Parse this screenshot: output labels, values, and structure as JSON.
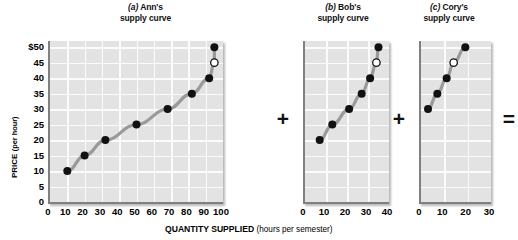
{
  "figure": {
    "axis_titles": {
      "y_main": "PRICE",
      "y_sub": "(per hour)",
      "x_main": "QUANTITY SUPPLIED",
      "x_sub": "(hours per semester)"
    },
    "operators": [
      {
        "symbol": "+",
        "name": "plus-operator-1"
      },
      {
        "symbol": "+",
        "name": "plus-operator-2"
      },
      {
        "symbol": "=",
        "name": "equals-operator"
      }
    ]
  },
  "chart_data": [
    {
      "type": "line",
      "panel": "a",
      "title_prefix": "(a)",
      "title_name": "Ann's",
      "title_line2": "supply curve",
      "xlabel": "QUANTITY SUPPLIED (hours per semester)",
      "ylabel": "PRICE (per hour)",
      "xlim": [
        0,
        100
      ],
      "ylim": [
        0,
        52
      ],
      "xticks": [
        0,
        10,
        20,
        30,
        40,
        50,
        60,
        70,
        80,
        90,
        100
      ],
      "yticks": [
        0,
        5,
        10,
        15,
        20,
        25,
        30,
        35,
        40,
        45,
        50
      ],
      "ytick_labels": [
        "0",
        "5",
        "10",
        "15",
        "20",
        "25",
        "30",
        "35",
        "40",
        "45",
        "$50"
      ],
      "grid": true,
      "x": [
        10,
        20,
        32,
        50,
        68,
        82,
        92,
        95,
        95
      ],
      "y": [
        10,
        15,
        20,
        25,
        30,
        35,
        40,
        45,
        50
      ],
      "marker_styles": [
        "filled",
        "filled",
        "filled",
        "filled",
        "filled",
        "filled",
        "filled",
        "open",
        "filled"
      ]
    },
    {
      "type": "line",
      "panel": "b",
      "title_prefix": "(b)",
      "title_name": "Bob's",
      "title_line2": "supply curve",
      "xlim": [
        0,
        40
      ],
      "ylim": [
        0,
        52
      ],
      "xticks": [
        0,
        10,
        20,
        30,
        40
      ],
      "yticks": [
        0,
        5,
        10,
        15,
        20,
        25,
        30,
        35,
        40,
        45,
        50
      ],
      "grid": true,
      "x": [
        7,
        13,
        21,
        27,
        31,
        34,
        35
      ],
      "y": [
        20,
        25,
        30,
        35,
        40,
        45,
        50
      ],
      "marker_styles": [
        "filled",
        "filled",
        "filled",
        "filled",
        "filled",
        "open",
        "filled"
      ]
    },
    {
      "type": "line",
      "panel": "c",
      "title_prefix": "(c)",
      "title_name": "Cory's",
      "title_line2": "supply curve",
      "xlim": [
        0,
        30
      ],
      "ylim": [
        0,
        52
      ],
      "xticks": [
        0,
        10,
        20,
        30
      ],
      "yticks": [
        0,
        5,
        10,
        15,
        20,
        25,
        30,
        35,
        40,
        45,
        50
      ],
      "grid": true,
      "x": [
        3,
        7,
        11,
        14,
        19
      ],
      "y": [
        30,
        35,
        40,
        45,
        50
      ],
      "marker_styles": [
        "filled",
        "filled",
        "filled",
        "open",
        "filled"
      ]
    }
  ]
}
